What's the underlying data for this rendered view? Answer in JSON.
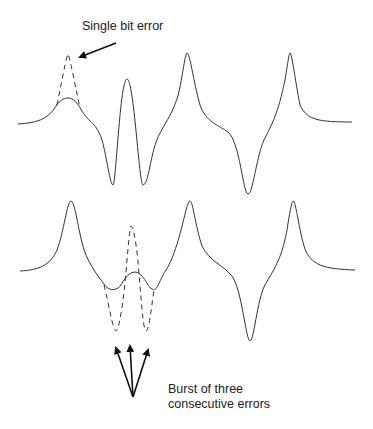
{
  "figure": {
    "labels": {
      "single_error": "Single bit error",
      "burst_line1": "Burst of three",
      "burst_line2": "consecutive errors"
    },
    "colors": {
      "waveform": "#333333",
      "arrow": "#111111",
      "text": "#222222",
      "background": "#ffffff"
    },
    "waveforms": [
      {
        "name": "single-bit-error-waveform",
        "description": "Pulse train with one degraded pulse; dashed line shows original pulse"
      },
      {
        "name": "burst-error-waveform",
        "description": "Pulse train with three consecutive degraded pulses; dashed lines show original pulses"
      }
    ]
  }
}
